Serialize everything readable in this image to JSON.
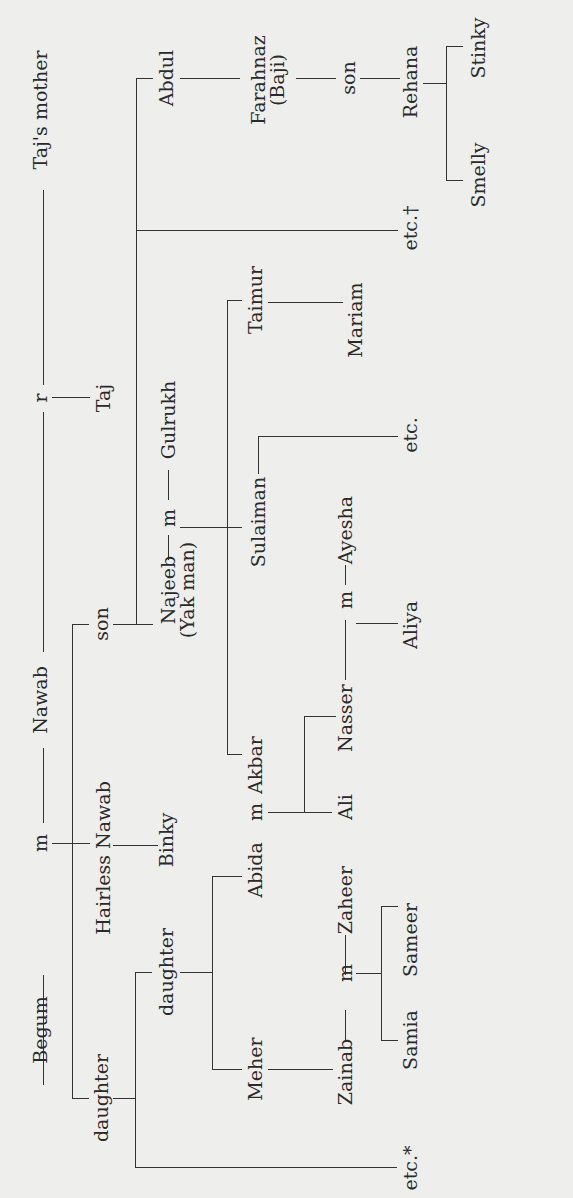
{
  "diagram": {
    "type": "family-tree",
    "orientation": "rotated-90-ccw",
    "colors": {
      "background": "#eeeeec",
      "line": "#333333",
      "text": "#2a2a2a"
    },
    "people": {
      "begum": "Begum",
      "nawab": "Nawab",
      "tajs_mother": "Taj's mother",
      "taj": "Taj",
      "hairless_nawab": "Hairless Nawab",
      "binky": "Binky",
      "daughter1": "daughter",
      "son1": "son",
      "daughter2": "daughter",
      "etc_star": "etc.*",
      "meher": "Meher",
      "abida": "Abida",
      "akbar": "Akbar",
      "zainab": "Zainab",
      "zaheer": "Zaheer",
      "samia": "Samia",
      "sameer": "Sameer",
      "ali": "Ali",
      "nasser": "Nasser",
      "ayesha": "Ayesha",
      "aliya": "Aliya",
      "najeeb": "Najeeb",
      "najeeb_alias": "(Yak man)",
      "gulrukh": "Gulrukh",
      "sulaiman": "Sulaiman",
      "etc_plain": "etc.",
      "taimur": "Taimur",
      "mariam": "Mariam",
      "abdul": "Abdul",
      "etc_dagger": "etc.†",
      "farahnaz": "Farahnaz",
      "farahnaz_alias": "(Baji)",
      "son2": "son",
      "rehana": "Rehana",
      "smelly": "Smelly",
      "stinky": "Stinky"
    },
    "relation_markers": {
      "married": "m",
      "relation": "r"
    }
  }
}
